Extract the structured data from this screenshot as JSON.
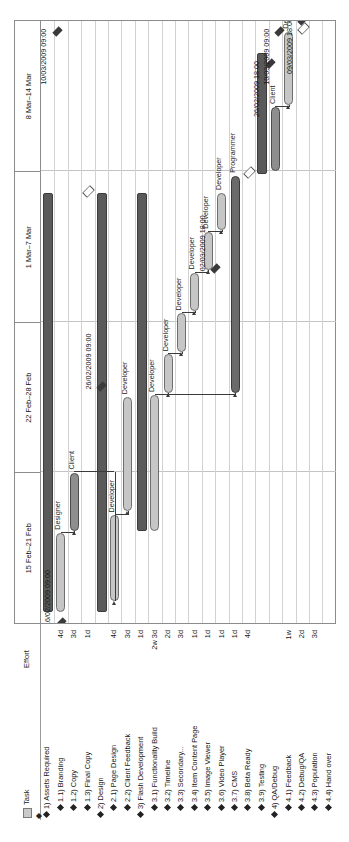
{
  "table": {
    "header": {
      "task": "Task",
      "effort": "Effort"
    },
    "legend": {
      "bar_icon": "summary-bar-swatch",
      "milestone_icon": "milestone-diamond"
    }
  },
  "chart_data": {
    "type": "gantt",
    "title": "",
    "timeline_label": "Weeks",
    "week_headers": [
      "15 Feb–21 Feb",
      "22 Feb–28 Feb",
      "1 Mar–7 Mar",
      "8 Mar–14 Mar"
    ],
    "date_range": [
      "15/02/2009",
      "14/03/2009"
    ],
    "rows": [
      {
        "name": "1) Assets Required",
        "effort": "",
        "level": 0,
        "kind": "summary",
        "start": 0.5,
        "end": 20.0,
        "resource": ""
      },
      {
        "name": "1.1) Branding",
        "effort": "4d",
        "level": 1,
        "kind": "task",
        "start": 0.5,
        "end": 4.2,
        "resource": "Designer"
      },
      {
        "name": "1.2) Copy",
        "effort": "3d",
        "level": 1,
        "kind": "taskdark",
        "start": 4.3,
        "end": 7.0,
        "resource": "Client"
      },
      {
        "name": "1.3) Final Copy",
        "effort": "1d",
        "level": 1,
        "kind": "milestone",
        "start": 20.0,
        "end": 20.0,
        "resource": ""
      },
      {
        "name": "2) Design",
        "effort": "3d",
        "level": 0,
        "kind": "summary",
        "start": 0.5,
        "end": 20.0,
        "resource": ""
      },
      {
        "name": "2.1) Page Design",
        "effort": "1d",
        "level": 1,
        "kind": "task",
        "start": 1.0,
        "end": 5.0,
        "resource": "Developer"
      },
      {
        "name": "2.2) Client Feedback",
        "effort": "2w 3d",
        "level": 1,
        "kind": "task",
        "start": 5.2,
        "end": 10.5,
        "resource": "Developer"
      },
      {
        "name": "3) Flash Development",
        "effort": "2d",
        "level": 0,
        "kind": "summary",
        "start": 4.3,
        "end": 20.0,
        "resource": ""
      },
      {
        "name": "3.1) Functionality Build",
        "effort": "3d",
        "level": 1,
        "kind": "task",
        "start": 4.3,
        "end": 10.6,
        "resource": "Developer"
      },
      {
        "name": "3.2) Timeline",
        "effort": "1d",
        "level": 1,
        "kind": "task",
        "start": 10.7,
        "end": 12.5,
        "resource": "Developer"
      },
      {
        "name": "3.3) Secondary...",
        "effort": "1d",
        "level": 1,
        "kind": "task",
        "start": 12.6,
        "end": 14.4,
        "resource": "Developer"
      },
      {
        "name": "3.4) Item Content Page",
        "effort": "1d",
        "level": 1,
        "kind": "task",
        "start": 14.5,
        "end": 16.3,
        "resource": "Developer"
      },
      {
        "name": "3.5) Image Viewer",
        "effort": "1d",
        "level": 1,
        "kind": "task",
        "start": 16.4,
        "end": 18.2,
        "resource": "Developer"
      },
      {
        "name": "3.6) Video Player",
        "effort": "4d",
        "level": 1,
        "kind": "task",
        "start": 18.3,
        "end": 20.0,
        "resource": "Developer"
      },
      {
        "name": "3.7) CMS",
        "effort": "",
        "level": 1,
        "kind": "taskdarker",
        "start": 10.7,
        "end": 20.8,
        "resource": "Programmer"
      },
      {
        "name": "3.8) Beta Ready",
        "effort": "1w",
        "level": 1,
        "kind": "milestone",
        "start": 20.9,
        "end": 20.9,
        "resource": ""
      },
      {
        "name": "3.9) Testing",
        "effort": "2d",
        "level": 1,
        "kind": "summary",
        "start": 20.9,
        "end": 26.5,
        "resource": ""
      },
      {
        "name": "4) QA/Debug",
        "effort": "3d",
        "level": 0,
        "kind": "taskdark",
        "start": 21.0,
        "end": 24.0,
        "resource": "Client"
      },
      {
        "name": "4.1) Feedback",
        "effort": "",
        "level": 1,
        "kind": "task",
        "start": 24.1,
        "end": 27.5,
        "resource": "Developer"
      },
      {
        "name": "4.2) Debug/QA",
        "effort": "",
        "level": 1,
        "kind": "milestone",
        "start": 27.6,
        "end": 27.6,
        "resource": ""
      },
      {
        "name": "4.3) Population",
        "effort": "",
        "level": 1,
        "kind": "none",
        "start": 0,
        "end": 0,
        "resource": ""
      },
      {
        "name": "4.4) Hand over",
        "effort": "",
        "level": 1,
        "kind": "none",
        "start": 0,
        "end": 0,
        "resource": ""
      }
    ],
    "effort_column": [
      "",
      "4d",
      "3d",
      "1d",
      "",
      "4d",
      "3d",
      "1d",
      "2w 3d",
      "2d",
      "3d",
      "1d",
      "1d",
      "1d",
      "1d",
      "4d",
      "",
      "",
      "1w",
      "2d",
      "3d",
      ""
    ],
    "milestone_labels": [
      {
        "text": "16/02/2009 09:00",
        "date": "16/02/2009 09:00"
      },
      {
        "text": "26/02/2009 09:00",
        "date": "26/02/2009 09:00"
      },
      {
        "text": "10/03/2009 09:00",
        "date": "10/03/2009 09:00"
      },
      {
        "text": "02/03/2009 18:00",
        "date": "02/03/2009 18:00"
      },
      {
        "text": "26/02/2009 18:00",
        "date": "26/02/2009 18:00"
      },
      {
        "text": "10/03/2009 09:00",
        "date": "10/03/2009 09:00"
      },
      {
        "text": "09/03/2009 18:00",
        "date": "09/03/2009 18:00"
      }
    ],
    "resources": [
      "Designer",
      "Client",
      "Developer",
      "Programmer"
    ],
    "colors": {
      "summary_bar": "#5a5a5a",
      "task_bar": "#c6c6c6",
      "task_bar_mid": "#8e8e8e",
      "task_bar_dark": "#6a6a6a",
      "grid": "#c4c4c4",
      "border": "#8c8c8c",
      "text": "#161616"
    }
  }
}
